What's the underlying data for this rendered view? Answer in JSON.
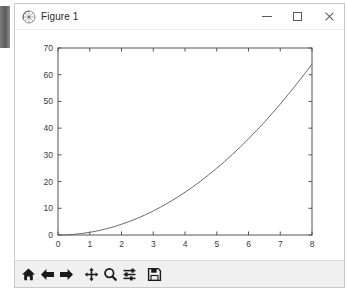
{
  "window": {
    "title": "Figure 1",
    "icon": "matplotlib-icon",
    "controls": {
      "minimize_label": "Minimize",
      "maximize_label": "Maximize",
      "close_label": "Close"
    }
  },
  "toolbar": {
    "buttons": [
      {
        "name": "home",
        "label": "Home",
        "tooltip": "Reset original view"
      },
      {
        "name": "back",
        "label": "Back",
        "tooltip": "Back to previous view"
      },
      {
        "name": "forward",
        "label": "Forward",
        "tooltip": "Forward to next view"
      },
      {
        "name": "pan",
        "label": "Pan",
        "tooltip": "Pan axes with left mouse, zoom with right"
      },
      {
        "name": "zoom",
        "label": "Zoom",
        "tooltip": "Zoom to rectangle"
      },
      {
        "name": "subplots",
        "label": "Subplots",
        "tooltip": "Configure subplots"
      },
      {
        "name": "save",
        "label": "Save",
        "tooltip": "Save the figure"
      }
    ]
  },
  "colors": {
    "line": "#6b6b6b",
    "spine": "#545454",
    "tick_label": "#3b3b3b",
    "canvas_bg": "#ffffff",
    "toolbar_bg": "#f0f0f0",
    "titlebar_bg": "#ffffff"
  },
  "chart_data": {
    "type": "line",
    "title": "",
    "xlabel": "",
    "ylabel": "",
    "xlim": [
      0,
      8
    ],
    "ylim": [
      0,
      70
    ],
    "grid": false,
    "legend": false,
    "xticks": [
      0,
      1,
      2,
      3,
      4,
      5,
      6,
      7,
      8
    ],
    "yticks": [
      0,
      10,
      20,
      30,
      40,
      50,
      60,
      70
    ],
    "xticklabels": [
      "0",
      "1",
      "2",
      "3",
      "4",
      "5",
      "6",
      "7",
      "8"
    ],
    "yticklabels": [
      "0",
      "10",
      "20",
      "30",
      "40",
      "50",
      "60",
      "70"
    ],
    "series": [
      {
        "name": "y = x^2",
        "color": "#6b6b6b",
        "linewidth": 1,
        "x": [
          0,
          0.25,
          0.5,
          0.75,
          1,
          1.25,
          1.5,
          1.75,
          2,
          2.25,
          2.5,
          2.75,
          3,
          3.25,
          3.5,
          3.75,
          4,
          4.25,
          4.5,
          4.75,
          5,
          5.25,
          5.5,
          5.75,
          6,
          6.25,
          6.5,
          6.75,
          7,
          7.25,
          7.5,
          7.75,
          8
        ],
        "y": [
          0,
          0.0625,
          0.25,
          0.5625,
          1,
          1.5625,
          2.25,
          3.0625,
          4,
          5.0625,
          6.25,
          7.5625,
          9,
          10.5625,
          12.25,
          14.0625,
          16,
          18.0625,
          20.25,
          22.5625,
          25,
          27.5625,
          30.25,
          33.0625,
          36,
          39.0625,
          42.25,
          45.5625,
          49,
          52.5625,
          56.25,
          60.0625,
          64
        ]
      }
    ]
  }
}
